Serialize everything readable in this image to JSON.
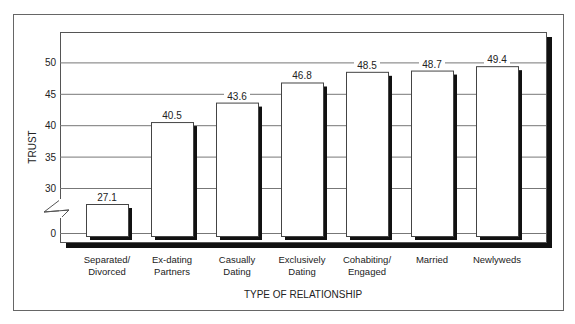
{
  "chart_data": {
    "type": "bar",
    "title": "",
    "xlabel": "TYPE OF RELATIONSHIP",
    "ylabel": "TRUST",
    "categories": [
      [
        "Separated/",
        "Divorced"
      ],
      [
        "Ex-dating",
        "Partners"
      ],
      [
        "Casually",
        "Dating"
      ],
      [
        "Exclusively",
        "Dating"
      ],
      [
        "Cohabiting/",
        "Engaged"
      ],
      [
        "Married"
      ],
      [
        "Newlyweds"
      ]
    ],
    "values": [
      27.1,
      40.5,
      43.6,
      46.8,
      48.5,
      48.7,
      49.4
    ],
    "value_labels": [
      "27.1",
      "40.5",
      "43.6",
      "46.8",
      "48.5",
      "48.7",
      "49.4"
    ],
    "yticks": [
      0,
      30,
      35,
      40,
      45,
      50
    ],
    "ylim": [
      0,
      55
    ],
    "axis_break": "between 0 and 30",
    "grid": true,
    "legend": null
  },
  "colors": {
    "bar_fill": "#ffffff",
    "bar_shadow": "#111111",
    "grid": "#777777",
    "frame": "#555555"
  }
}
